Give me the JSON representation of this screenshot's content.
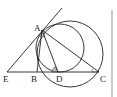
{
  "diagram": {
    "type": "geometry",
    "points": {
      "A": {
        "label": "A",
        "x": 42,
        "y": 30
      },
      "B": {
        "label": "B",
        "x": 37,
        "y": 72
      },
      "C": {
        "label": "C",
        "x": 99,
        "y": 72
      },
      "D": {
        "label": "D",
        "x": 58,
        "y": 72
      },
      "E": {
        "label": "E",
        "x": 7,
        "y": 72
      }
    },
    "segments": [
      "EC",
      "AB",
      "AD",
      "AC",
      "EA (extended tangent)"
    ],
    "circles": [
      {
        "name": "circumcircle-ABC",
        "cx": 70,
        "cy": 54,
        "r": 33
      },
      {
        "name": "circle-tangent-at-D-through-A",
        "cx": 60,
        "cy": 48,
        "r": 24
      }
    ],
    "angle_marks": [
      "angle at A (between AB and AD)",
      "angle ADB at D",
      "angle ACB at C"
    ],
    "stroke_color": "#222222",
    "angle_fill": "#bbbbbb"
  }
}
